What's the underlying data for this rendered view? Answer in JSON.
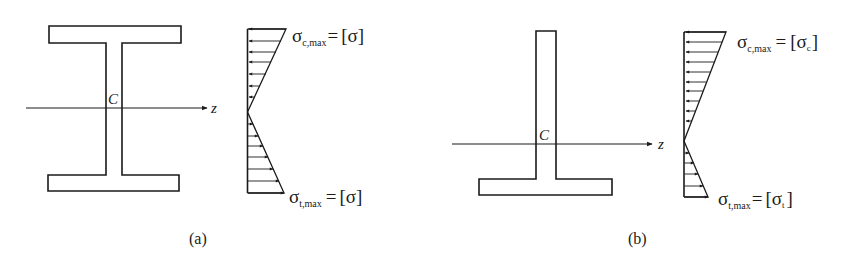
{
  "figures": [
    {
      "id": "a",
      "caption": "(a)",
      "section": "I-section",
      "centroid_label": "C",
      "axis_label": "z",
      "top_stress": {
        "symbol": "σ",
        "subscript": "c,max",
        "equals": "=",
        "value": "[σ]"
      },
      "bottom_stress": {
        "symbol": "σ",
        "subscript": "t,max",
        "equals": "=",
        "value": "[σ]"
      }
    },
    {
      "id": "b",
      "caption": "(b)",
      "section": "T-section",
      "centroid_label": "C",
      "axis_label": "z",
      "top_stress": {
        "symbol": "σ",
        "subscript": "c,max",
        "equals": "=",
        "value_bracket_open": "[",
        "value_symbol": "σ",
        "value_subscript": "c",
        "value_bracket_close": "]"
      },
      "bottom_stress": {
        "symbol": "σ",
        "subscript": "t,max",
        "equals": "=",
        "value_bracket_open": "[",
        "value_symbol": "σ",
        "value_subscript": "t",
        "value_bracket_close": "]"
      }
    }
  ],
  "colors": {
    "stroke": "#1a1a1a",
    "background": "#ffffff"
  }
}
